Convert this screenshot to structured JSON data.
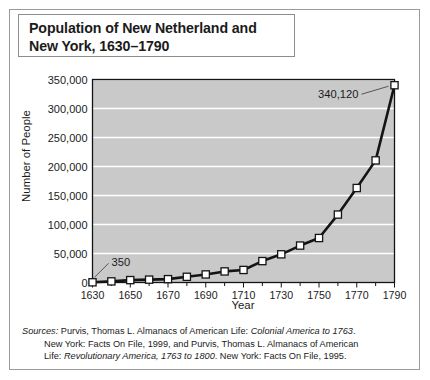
{
  "figure": {
    "title_lines": [
      "Population of New Netherland and",
      "New York, 1630–1790"
    ],
    "sources_label": "Sources:",
    "sources_lines": [
      "Purvis, Thomas L. Almanacs of American Life: ",
      "New York: Facts On File, 1999, and Purvis, Thomas L. Almanacs of American",
      "Life: "
    ],
    "sources_italic": [
      "Colonial America to 1763",
      "Revolutionary America, 1763 to 1800"
    ],
    "sources_tail": [
      ".",
      ". New York: Facts On File, 1995."
    ],
    "colors": {
      "plot_background": "#c9c9c9",
      "gridline": "#ffffff",
      "line": "#141414",
      "marker_fill": "#ffffff",
      "marker_stroke": "#141414",
      "axis": "#141414",
      "border": "#9a9a9a",
      "text": "#1b1b1b"
    }
  },
  "chart_data": {
    "type": "line",
    "title": "Population of New Netherland and New York, 1630–1790",
    "xlabel": "Year",
    "ylabel": "Number of People",
    "xlim": [
      1630,
      1790
    ],
    "ylim": [
      0,
      350000
    ],
    "xticks": [
      1630,
      1650,
      1670,
      1690,
      1710,
      1730,
      1750,
      1770,
      1790
    ],
    "xtick_labels": [
      "1630",
      "1650",
      "1670",
      "1690",
      "1710",
      "1730",
      "1750",
      "1770",
      "1790"
    ],
    "yticks": [
      0,
      50000,
      100000,
      150000,
      200000,
      250000,
      300000,
      350000
    ],
    "ytick_labels": [
      "0",
      "50,000",
      "100,000",
      "150,000",
      "200,000",
      "250,000",
      "300,000",
      "350,000"
    ],
    "grid": true,
    "legend": false,
    "marker": "square",
    "x": [
      1630,
      1640,
      1650,
      1660,
      1670,
      1680,
      1690,
      1700,
      1710,
      1720,
      1730,
      1740,
      1750,
      1760,
      1770,
      1780,
      1790
    ],
    "values": [
      350,
      1930,
      4116,
      4936,
      5754,
      9830,
      13909,
      19107,
      21625,
      36919,
      48594,
      63665,
      76696,
      117138,
      162920,
      210541,
      340120
    ],
    "annotations": [
      {
        "label": "350",
        "x": 1630,
        "y": 350
      },
      {
        "label": "340,120",
        "x": 1790,
        "y": 340120
      }
    ]
  }
}
